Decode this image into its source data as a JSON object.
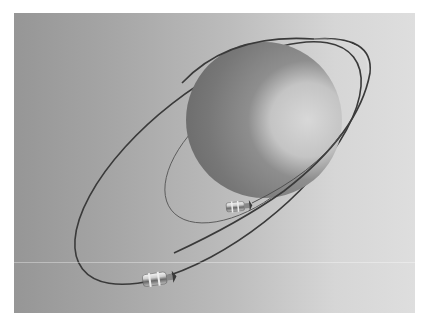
{
  "scene": {
    "title": "Planet with orbiting satellites",
    "background": {
      "left_color": "#969696",
      "right_color": "#dedede"
    },
    "sphere": {
      "cx": 250,
      "cy": 107,
      "r": 78,
      "dark_color": "#6e6e6e",
      "light_color": "#d2d2d2"
    },
    "orbits": [
      {
        "name": "outer-orbit",
        "cx": 204,
        "cy": 150,
        "rx": 172,
        "ry": 75,
        "rotation": -38,
        "color": "#3a3a3a"
      },
      {
        "name": "inner-orbit",
        "cx": 233,
        "cy": 138,
        "rx": 96,
        "ry": 52,
        "rotation": -38,
        "color": "#555555"
      }
    ],
    "satellites": [
      {
        "name": "satellite-large",
        "x": 142,
        "y": 275,
        "scale": 1.0
      },
      {
        "name": "satellite-small",
        "x": 238,
        "y": 203,
        "scale": 0.8
      }
    ]
  }
}
